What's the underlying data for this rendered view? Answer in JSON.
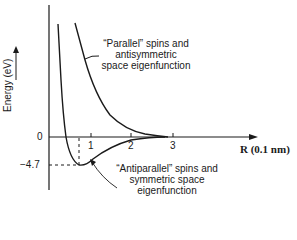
{
  "diagram": {
    "type": "potential-energy-curves",
    "y_axis": {
      "label": "Energy (eV)",
      "ticks": [
        "0",
        "−4.7"
      ]
    },
    "x_axis": {
      "label": "R (0.1 nm)",
      "ticks": [
        "1",
        "2",
        "3"
      ]
    },
    "curves": [
      {
        "name": "parallel",
        "annotation": [
          "“Parallel” spins and",
          "antisymmetric",
          "space eigenfunction"
        ]
      },
      {
        "name": "antiparallel",
        "annotation": [
          "“Antiparallel” spins and",
          "symmetric space",
          "eigenfunction"
        ],
        "minimum": {
          "R": 0.74,
          "energy": -4.7
        }
      }
    ]
  },
  "colors": {
    "line": "#1a1a1a",
    "background": "#ffffff"
  }
}
